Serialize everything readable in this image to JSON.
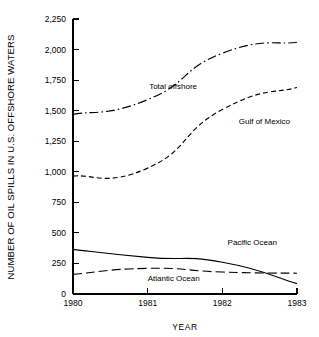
{
  "chart_data": {
    "type": "line",
    "title": "",
    "xlabel": "YEAR",
    "ylabel": "NUMBER OF OIL SPILLS IN U.S. OFFSHORE WATERS",
    "x": [
      1980,
      1981,
      1982,
      1983
    ],
    "categories": [
      "1980",
      "1981",
      "1982",
      "1983"
    ],
    "xlim": [
      1980,
      1983
    ],
    "ylim": [
      0,
      2250
    ],
    "ytick_labels": [
      "0",
      "250",
      "500",
      "750",
      "1,000",
      "1,250",
      "1,500",
      "1,750",
      "2,000",
      "2,250"
    ],
    "ytick_values": [
      0,
      250,
      500,
      750,
      1000,
      1250,
      1500,
      1750,
      2000,
      2250
    ],
    "xtick_labels": [
      "1980",
      "1981",
      "1982",
      "1983"
    ],
    "grid": false,
    "legend_position": "inline-annotations",
    "series": [
      {
        "name": "Total offshore",
        "label": "Total offshore",
        "style": "dash-dot",
        "color": "#000000",
        "values": [
          1470,
          1590,
          1970,
          2060
        ],
        "label_x": 1981.02,
        "label_y": 1680
      },
      {
        "name": "Gulf of Mexico",
        "label": "Gulf of Mexico",
        "style": "dashed",
        "color": "#000000",
        "values": [
          965,
          1030,
          1510,
          1690
        ],
        "label_x": 1982.22,
        "label_y": 1390
      },
      {
        "name": "Pacific Ocean",
        "label": "Pacific Ocean",
        "style": "solid",
        "color": "#000000",
        "values": [
          365,
          300,
          260,
          85
        ],
        "label_x": 1982.07,
        "label_y": 400
      },
      {
        "name": "Atlantic Ocean",
        "label": "Atlantic Ocean",
        "style": "long-dash",
        "color": "#000000",
        "values": [
          160,
          210,
          180,
          170
        ],
        "label_x": 1981.0,
        "label_y": 105
      }
    ]
  }
}
